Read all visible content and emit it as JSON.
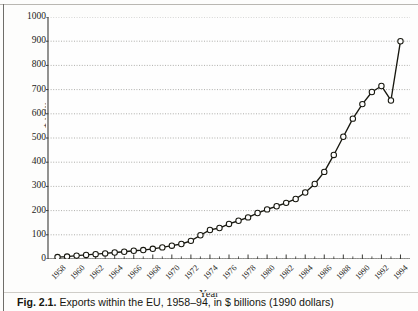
{
  "figure": {
    "caption_label": "Fig. 2.1.",
    "caption_text": "Exports within the EU, 1958–94, in $ billions (1990 dollars)"
  },
  "chart_data": {
    "type": "line",
    "title": "",
    "xlabel": "Year",
    "ylabel": "$ billions",
    "xlim": [
      1957,
      1995
    ],
    "ylim": [
      0,
      1000
    ],
    "ytick_values": [
      0,
      100,
      200,
      300,
      400,
      500,
      600,
      700,
      800,
      900,
      1000
    ],
    "ytick_labels": [
      "0",
      "100",
      "200",
      "300",
      "400",
      "500",
      "600",
      "700",
      "800",
      "900",
      "1000"
    ],
    "xtick_values": [
      1958,
      1960,
      1962,
      1964,
      1966,
      1968,
      1970,
      1972,
      1974,
      1976,
      1978,
      1980,
      1982,
      1984,
      1986,
      1988,
      1990,
      1992,
      1994
    ],
    "xtick_labels": [
      "1958",
      "1960",
      "1962",
      "1964",
      "1966",
      "1968",
      "1970",
      "1972",
      "1974",
      "1976",
      "1978",
      "1980",
      "1982",
      "1984",
      "1986",
      "1988",
      "1990",
      "1992",
      "1994"
    ],
    "grid": true,
    "grid_axis": "y",
    "legend": "none",
    "marker": "open-circle",
    "series": [
      {
        "name": "Exports within the EU",
        "x": [
          1958,
          1959,
          1960,
          1961,
          1962,
          1963,
          1964,
          1965,
          1966,
          1967,
          1968,
          1969,
          1970,
          1971,
          1972,
          1973,
          1974,
          1975,
          1976,
          1977,
          1978,
          1979,
          1980,
          1981,
          1982,
          1983,
          1984,
          1985,
          1986,
          1987,
          1988,
          1989,
          1990,
          1991,
          1992,
          1993,
          1994
        ],
        "values": [
          8,
          10,
          14,
          17,
          20,
          23,
          27,
          30,
          34,
          37,
          42,
          48,
          55,
          62,
          75,
          98,
          120,
          128,
          145,
          158,
          172,
          190,
          205,
          218,
          232,
          248,
          275,
          310,
          360,
          430,
          505,
          580,
          640,
          690,
          715,
          655,
          900
        ]
      }
    ]
  }
}
